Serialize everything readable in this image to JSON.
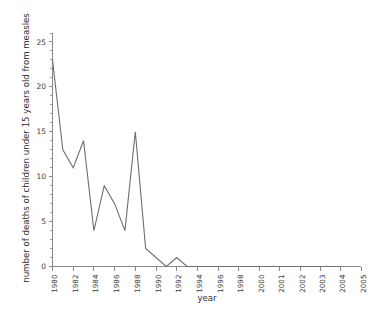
{
  "chart_data": {
    "type": "line",
    "title": "",
    "xlabel": "year",
    "ylabel": "number of deaths of children under 15 years old from measles",
    "xlim": [
      1980,
      2005
    ],
    "ylim": [
      0,
      26
    ],
    "grid": false,
    "legend": null,
    "y_ticks": [
      0,
      5,
      10,
      15,
      20,
      25
    ],
    "y_tick_labels": [
      "0",
      "5",
      "10",
      "15",
      "20",
      "25"
    ],
    "y_minor_tick_step": 1,
    "x_tick_labels": [
      "1980",
      "1982",
      "1984",
      "1986",
      "1988",
      "1990",
      "1992",
      "1994",
      "1996",
      "1998",
      "2000",
      "2001",
      "2002",
      "2003",
      "2004",
      "2005"
    ],
    "x_tick_values": [
      1980,
      1982,
      1984,
      1986,
      1988,
      1990,
      1992,
      1994,
      1996,
      1998,
      2000,
      2001,
      2002,
      2003,
      2004,
      2005
    ],
    "x_axis_note": "compressed biennial spacing 1980-2000, expanded annual spacing 2000-2005",
    "x": [
      1980,
      1981,
      1982,
      1983,
      1984,
      1985,
      1986,
      1987,
      1988,
      1989,
      1990,
      1991,
      1992,
      1993,
      1994,
      1995,
      1996,
      1997,
      1998,
      1999,
      2000,
      2001,
      2002,
      2003,
      2004
    ],
    "values": [
      23,
      13,
      11,
      14,
      4,
      9,
      7,
      4,
      15,
      2,
      1,
      0,
      1,
      0,
      0,
      0,
      0,
      0,
      0,
      0,
      0,
      0,
      0,
      0,
      0
    ],
    "series": [
      {
        "name": "deaths under 15 from measles",
        "color": "#6e6e6e",
        "values": [
          23,
          13,
          11,
          14,
          4,
          9,
          7,
          4,
          15,
          2,
          1,
          0,
          1,
          0,
          0,
          0,
          0,
          0,
          0,
          0,
          0,
          0,
          0,
          0,
          0
        ]
      }
    ]
  },
  "colors": {
    "background": "#ffffff",
    "line": "#6e6e6e",
    "axis": "#8a8a8a",
    "text": "#3a3a3a"
  }
}
